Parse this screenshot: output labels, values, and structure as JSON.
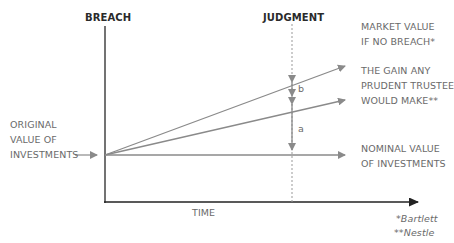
{
  "diagram": {
    "labels": {
      "breach": "BREACH",
      "judgment": "JUDGMENT",
      "market_value_line1": "MARKET VALUE",
      "market_value_line2": "IF NO BREACH*",
      "prudent_line1": "THE GAIN ANY",
      "prudent_line2": "PRUDENT TRUSTEE",
      "prudent_line3": "WOULD MAKE**",
      "original_line1": "ORIGINAL",
      "original_line2": "VALUE OF",
      "original_line3": "INVESTMENTS",
      "nominal_line1": "NOMINAL VALUE",
      "nominal_line2": "OF INVESTMENTS",
      "time": "TIME",
      "gap_b": "b",
      "gap_a": "a",
      "footnote1": "*Bartlett",
      "footnote2": "**Nestle"
    },
    "colors": {
      "line": "#8a8a8a",
      "axis": "#333333",
      "text": "#6a6a6a",
      "heading": "#2a2a2a"
    }
  }
}
